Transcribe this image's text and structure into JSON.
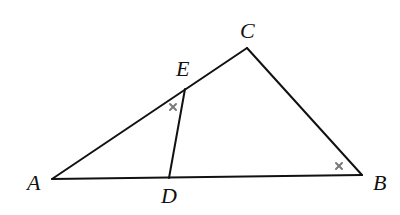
{
  "figure": {
    "type": "triangle-with-segment",
    "points": {
      "A": {
        "label": "A"
      },
      "B": {
        "label": "B"
      },
      "C": {
        "label": "C"
      },
      "D": {
        "label": "D",
        "on_segment": "AB"
      },
      "E": {
        "label": "E",
        "on_segment": "AC"
      }
    },
    "segments": [
      "AB",
      "BC",
      "CA",
      "DE"
    ],
    "angle_marks": [
      {
        "angle": "AED",
        "symbol": "×",
        "meaning": "equal-angle"
      },
      {
        "angle": "ABC",
        "symbol": "×",
        "meaning": "equal-angle"
      }
    ],
    "colors": {
      "line": "#111111",
      "mark": "#7a7a7a",
      "background": "#ffffff"
    }
  }
}
